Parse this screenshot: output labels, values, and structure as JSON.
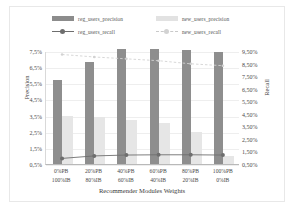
{
  "chart_data": {
    "type": "bar",
    "title": "",
    "xlabel": "Recommender Modules Weights",
    "ylabel": "Precision",
    "y2label": "Recall",
    "categories": [
      "0%PB\n100%IB",
      "20%PB\n80%IB",
      "40%PB\n60%IB",
      "60%PB\n40%IB",
      "80%PB\n20%IB",
      "100%PB\n0%IB"
    ],
    "categories_line1": [
      "0%PB",
      "20%PB",
      "40%PB",
      "60%PB",
      "80%PB",
      "100%PB"
    ],
    "categories_line2": [
      "100%IB",
      "80%IB",
      "60%IB",
      "40%IB",
      "20%IB",
      "0%IB"
    ],
    "ylim": [
      0.5,
      7.5
    ],
    "y2lim": [
      0.5,
      9.5
    ],
    "yticks": [
      "0,5%",
      "1,5%",
      "2,5%",
      "3,5%",
      "4,5%",
      "5,5%",
      "6,5%",
      "7,5%"
    ],
    "ytick_values": [
      0.5,
      1.5,
      2.5,
      3.5,
      4.5,
      5.5,
      6.5,
      7.5
    ],
    "y2ticks": [
      "0,50%",
      "1,50%",
      "2,50%",
      "3,50%",
      "4,50%",
      "5,50%",
      "6,50%",
      "7,50%",
      "8,50%",
      "9,50%"
    ],
    "y2tick_values": [
      0.5,
      1.5,
      2.5,
      3.5,
      4.5,
      5.5,
      6.5,
      7.5,
      8.5,
      9.5
    ],
    "grid": true,
    "legend_position": "top",
    "series": [
      {
        "name": "reg_users_precision",
        "kind": "bar",
        "axis": "left",
        "color": "#8e8e8e",
        "values": [
          5.7,
          6.8,
          7.6,
          7.65,
          7.55,
          7.45
        ]
      },
      {
        "name": "new_users_precision",
        "kind": "bar",
        "axis": "left",
        "color": "#e6e6e6",
        "values": [
          3.45,
          3.4,
          3.2,
          3.05,
          2.5,
          1.0
        ]
      },
      {
        "name": "reg_users_recall",
        "kind": "line",
        "axis": "right",
        "color": "#6e6e6e",
        "values": [
          0.95,
          1.15,
          1.22,
          1.24,
          1.24,
          1.22
        ]
      },
      {
        "name": "new_users_recall",
        "kind": "line",
        "axis": "right",
        "color": "#d2d2d2",
        "values": [
          9.3,
          9.1,
          8.95,
          8.8,
          8.55,
          8.4
        ]
      }
    ]
  },
  "legend": {
    "items": [
      {
        "label": "reg_users_precision",
        "marker": "bar-dark"
      },
      {
        "label": "new_users_precision",
        "marker": "bar-light"
      },
      {
        "label": "reg_users_recall",
        "marker": "line-solid"
      },
      {
        "label": "new_users_recall",
        "marker": "line-dashed"
      }
    ]
  }
}
